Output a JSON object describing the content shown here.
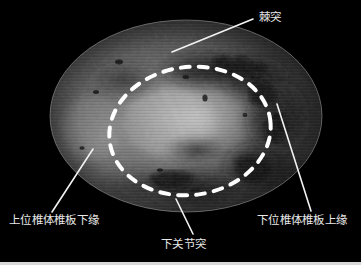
{
  "figure": {
    "type": "endoscopic-surgical-photograph",
    "modality": "spinal endoscopy",
    "width": 361,
    "height": 265,
    "background_color": "#000000",
    "field_of_view": {
      "shape": "ellipse",
      "center_x": 186,
      "center_y": 116,
      "radius_x": 136,
      "radius_y": 96,
      "rim_color": "#9a9a9a"
    },
    "overlay": {
      "dashed_ellipse": {
        "color": "#ffffff",
        "center_x": 190,
        "center_y": 131,
        "radius_x": 81,
        "radius_y": 64,
        "rotation_deg": -8,
        "dash": "9 9",
        "stroke_width": 4
      },
      "leader_line_color": "#f2f2f2",
      "leader_line_width": 1.6
    }
  },
  "labels": [
    {
      "id": "spinous-process",
      "text": "棘突",
      "x": 259,
      "y": 11,
      "leader": {
        "x1": 172,
        "y1": 52,
        "x2": 253,
        "y2": 19
      }
    },
    {
      "id": "upper-lamina-lower-margin",
      "text": "上位椎体椎板下缘",
      "x": 9,
      "y": 214,
      "leader": {
        "x1": 93,
        "y1": 149,
        "x2": 52,
        "y2": 212
      }
    },
    {
      "id": "inferior-articular-process",
      "text": "下关节突",
      "x": 161,
      "y": 238,
      "leader": {
        "x1": 176,
        "y1": 199,
        "x2": 193,
        "y2": 234
      }
    },
    {
      "id": "lower-lamina-upper-margin",
      "text": "下位椎体椎板上缘",
      "x": 257,
      "y": 214,
      "leader": {
        "x1": 277,
        "y1": 104,
        "x2": 311,
        "y2": 211
      }
    }
  ],
  "bottom_strip": {
    "color": "#d8d8d8",
    "height": 3
  }
}
